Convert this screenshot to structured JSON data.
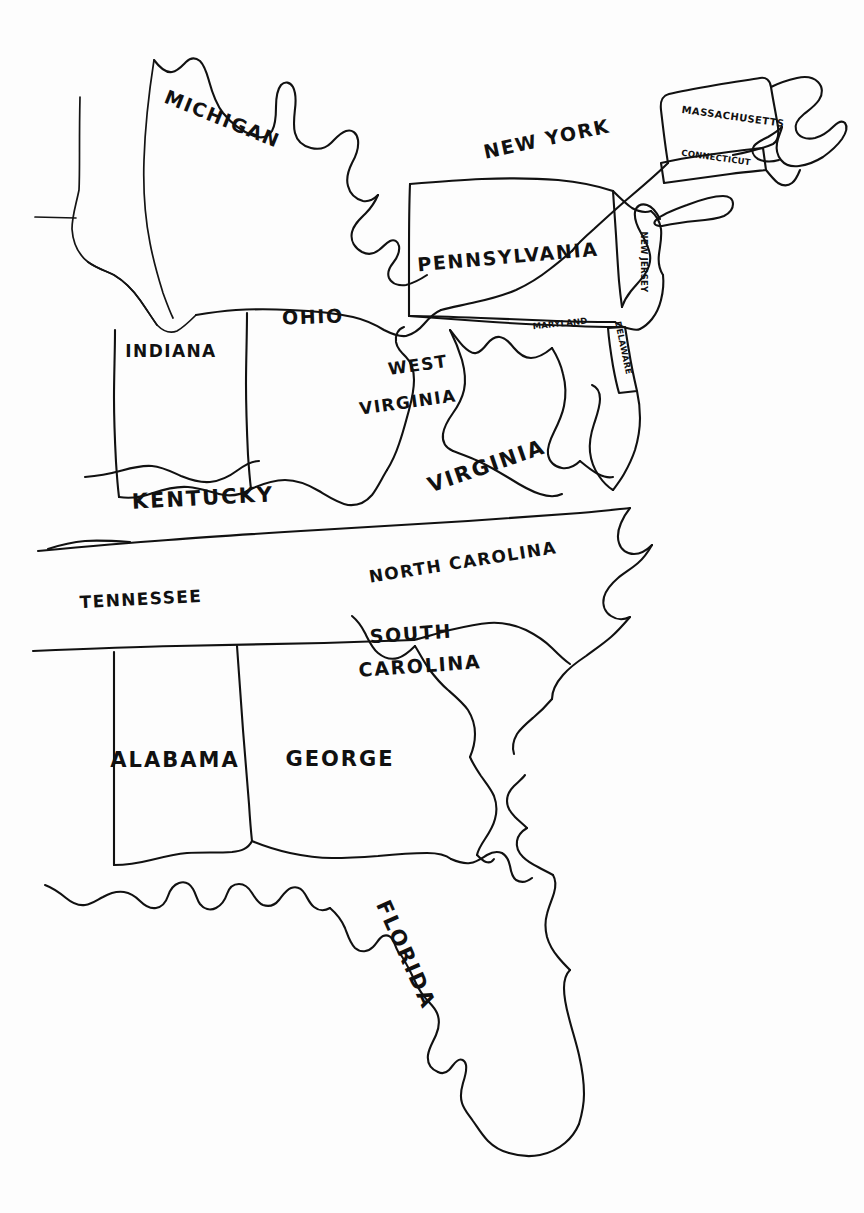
{
  "document": {
    "kind": "hand-drawn-map",
    "subject": "Eastern United States",
    "medium": "black ink line drawing on white paper",
    "width": 864,
    "height": 1213,
    "background_color": "#fdfdfd",
    "ink_color": "#111111"
  },
  "labels": {
    "michigan": "MICHIGAN",
    "new_york": "NEW YORK",
    "massachusetts": "MASSACHUSETTS",
    "connecticut": "CONNECTICUT",
    "pennsylvania": "PENNSYLVANIA",
    "new_jersey": "NEW JERSEY",
    "ohio": "OHIO",
    "indiana": "INDIANA",
    "maryland": "MARYLAND",
    "delaware": "DELAWARE",
    "west_virginia_line1": "WEST",
    "west_virginia_line2": "VIRGINIA",
    "virginia": "VIRGINIA",
    "kentucky": "KENTUCKY",
    "tennessee": "TENNESSEE",
    "north_carolina": "NORTH CAROLINA",
    "south_carolina_line1": "SOUTH",
    "south_carolina_line2": "CAROLINA",
    "alabama": "ALABAMA",
    "george": "GEORGE",
    "florida": "FLORIDA"
  },
  "states": [
    {
      "key": "michigan",
      "name": "MICHIGAN",
      "label_rotation": 22,
      "x": 222,
      "y": 120
    },
    {
      "key": "new_york",
      "name": "NEW YORK",
      "label_rotation": -12,
      "x": 547,
      "y": 140
    },
    {
      "key": "massachusetts",
      "name": "MASSACHUSETTS",
      "label_rotation": 8,
      "x": 733,
      "y": 117
    },
    {
      "key": "connecticut",
      "name": "CONNECTICUT",
      "label_rotation": 8,
      "x": 716,
      "y": 158
    },
    {
      "key": "pennsylvania",
      "name": "PENNSYLVANIA",
      "label_rotation": -5,
      "x": 508,
      "y": 258
    },
    {
      "key": "new_jersey",
      "name": "NEW JERSEY",
      "label_rotation": 90,
      "x": 643,
      "y": 262
    },
    {
      "key": "ohio",
      "name": "OHIO",
      "label_rotation": -2,
      "x": 313,
      "y": 318
    },
    {
      "key": "indiana",
      "name": "INDIANA",
      "label_rotation": 0,
      "x": 171,
      "y": 352
    },
    {
      "key": "maryland",
      "name": "MARYLAND",
      "label_rotation": -6,
      "x": 560,
      "y": 324
    },
    {
      "key": "delaware",
      "name": "DELAWARE",
      "label_rotation": 78,
      "x": 623,
      "y": 344
    },
    {
      "key": "west_virginia",
      "name": "WEST VIRGINIA",
      "label_rotation": -6,
      "x": 412,
      "y": 382
    },
    {
      "key": "virginia",
      "name": "VIRGINIA",
      "label_rotation": -19,
      "x": 487,
      "y": 467
    },
    {
      "key": "kentucky",
      "name": "KENTUCKY",
      "label_rotation": -3,
      "x": 203,
      "y": 499
    },
    {
      "key": "tennessee",
      "name": "TENNESSEE",
      "label_rotation": -3,
      "x": 141,
      "y": 600
    },
    {
      "key": "north_carolina",
      "name": "NORTH CAROLINA",
      "label_rotation": -9,
      "x": 463,
      "y": 563
    },
    {
      "key": "south_carolina",
      "name": "SOUTH CAROLINA",
      "label_rotation": -4,
      "x": 411,
      "y": 645
    },
    {
      "key": "alabama",
      "name": "ALABAMA",
      "label_rotation": 0,
      "x": 175,
      "y": 761
    },
    {
      "key": "george",
      "name": "GEORGE",
      "label_rotation": 0,
      "x": 340,
      "y": 760
    },
    {
      "key": "florida",
      "name": "FLORIDA",
      "label_rotation": 66,
      "x": 405,
      "y": 955
    }
  ],
  "state_count": 19,
  "notes": {
    "spelling_observed": "GEORGE"
  }
}
